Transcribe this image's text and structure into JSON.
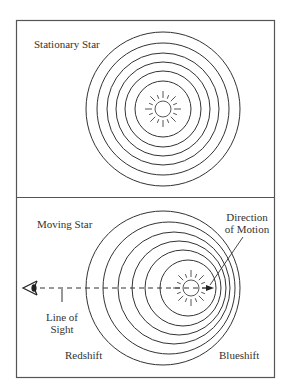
{
  "diagram": {
    "panels": [
      {
        "id": "stationary",
        "label": "Stationary Star",
        "star": {
          "cx": 163,
          "cy": 109,
          "r": 8
        },
        "wavefronts": [
          {
            "cx": 163,
            "cy": 109,
            "r": 77
          },
          {
            "cx": 163,
            "cy": 109,
            "r": 66
          },
          {
            "cx": 163,
            "cy": 109,
            "r": 56
          },
          {
            "cx": 163,
            "cy": 109,
            "r": 47
          },
          {
            "cx": 163,
            "cy": 109,
            "r": 38
          },
          {
            "cx": 163,
            "cy": 109,
            "r": 28
          }
        ]
      },
      {
        "id": "moving",
        "label": "Moving Star",
        "star": {
          "cx": 191,
          "cy": 288,
          "r": 8
        },
        "wavefronts": [
          {
            "cx": 163,
            "cy": 288,
            "r": 77
          },
          {
            "cx": 169,
            "cy": 288,
            "r": 66
          },
          {
            "cx": 174,
            "cy": 288,
            "r": 56
          },
          {
            "cx": 179,
            "cy": 288,
            "r": 47
          },
          {
            "cx": 183,
            "cy": 288,
            "r": 38
          },
          {
            "cx": 188,
            "cy": 288,
            "r": 28
          }
        ],
        "annotations": {
          "direction_line1": "Direction",
          "direction_line2": "of Motion",
          "line_of_sight_line1": "Line of",
          "line_of_sight_line2": "Sight",
          "redshift": "Redshift",
          "blueshift": "Blueshift"
        },
        "icons": [
          "eye-icon",
          "arrow-right-icon",
          "star-icon"
        ]
      }
    ],
    "colors": {
      "line": "#333333",
      "frame": "#555555",
      "background": "#ffffff"
    }
  }
}
